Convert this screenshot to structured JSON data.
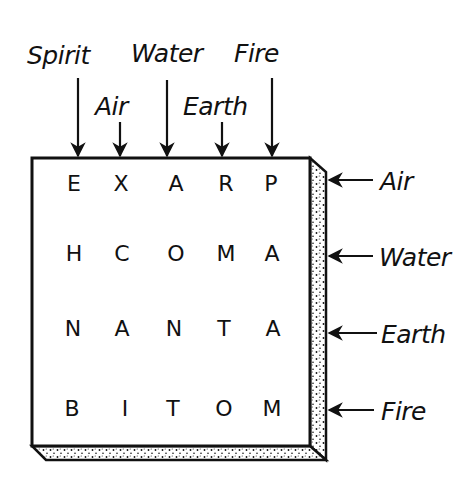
{
  "diagram": {
    "top_labels": [
      {
        "text": "Spirit",
        "column": 1
      },
      {
        "text": "Air",
        "column": 2
      },
      {
        "text": "Water",
        "column": 3
      },
      {
        "text": "Earth",
        "column": 4
      },
      {
        "text": "Fire",
        "column": 5
      }
    ],
    "side_labels": [
      {
        "text": "Air",
        "row": 1
      },
      {
        "text": "Water",
        "row": 2
      },
      {
        "text": "Earth",
        "row": 3
      },
      {
        "text": "Fire",
        "row": 4
      }
    ],
    "grid": [
      [
        "E",
        "X",
        "A",
        "R",
        "P"
      ],
      [
        "H",
        "C",
        "O",
        "M",
        "A"
      ],
      [
        "N",
        "A",
        "N",
        "T",
        "A"
      ],
      [
        "B",
        "I",
        "T",
        "O",
        "M"
      ]
    ],
    "colors": {
      "ink": "#111111",
      "background": "#ffffff",
      "slab_fill": "#f4f4f4"
    }
  }
}
